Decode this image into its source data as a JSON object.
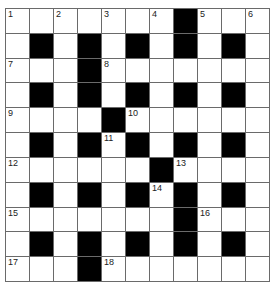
{
  "crossword": {
    "rows": 11,
    "cols": 11,
    "colors": {
      "block": "#000000",
      "cell": "#ffffff",
      "line": "#6a6a6a"
    },
    "blocks": [
      [
        0,
        7
      ],
      [
        1,
        1
      ],
      [
        1,
        3
      ],
      [
        1,
        5
      ],
      [
        1,
        7
      ],
      [
        1,
        9
      ],
      [
        2,
        3
      ],
      [
        3,
        1
      ],
      [
        3,
        3
      ],
      [
        3,
        5
      ],
      [
        3,
        7
      ],
      [
        3,
        9
      ],
      [
        4,
        4
      ],
      [
        5,
        1
      ],
      [
        5,
        3
      ],
      [
        5,
        5
      ],
      [
        5,
        7
      ],
      [
        5,
        9
      ],
      [
        6,
        6
      ],
      [
        7,
        1
      ],
      [
        7,
        3
      ],
      [
        7,
        5
      ],
      [
        7,
        7
      ],
      [
        7,
        9
      ],
      [
        8,
        7
      ],
      [
        9,
        1
      ],
      [
        9,
        3
      ],
      [
        9,
        5
      ],
      [
        9,
        7
      ],
      [
        9,
        9
      ],
      [
        10,
        3
      ]
    ],
    "numbers": [
      {
        "r": 0,
        "c": 0,
        "n": "1"
      },
      {
        "r": 0,
        "c": 2,
        "n": "2"
      },
      {
        "r": 0,
        "c": 4,
        "n": "3"
      },
      {
        "r": 0,
        "c": 6,
        "n": "4"
      },
      {
        "r": 0,
        "c": 8,
        "n": "5"
      },
      {
        "r": 0,
        "c": 10,
        "n": "6"
      },
      {
        "r": 2,
        "c": 0,
        "n": "7"
      },
      {
        "r": 2,
        "c": 4,
        "n": "8"
      },
      {
        "r": 4,
        "c": 0,
        "n": "9"
      },
      {
        "r": 4,
        "c": 5,
        "n": "10"
      },
      {
        "r": 5,
        "c": 4,
        "n": "11"
      },
      {
        "r": 6,
        "c": 0,
        "n": "12"
      },
      {
        "r": 6,
        "c": 7,
        "n": "13"
      },
      {
        "r": 7,
        "c": 6,
        "n": "14"
      },
      {
        "r": 8,
        "c": 0,
        "n": "15"
      },
      {
        "r": 8,
        "c": 8,
        "n": "16"
      },
      {
        "r": 10,
        "c": 0,
        "n": "17"
      },
      {
        "r": 10,
        "c": 4,
        "n": "18"
      }
    ]
  }
}
